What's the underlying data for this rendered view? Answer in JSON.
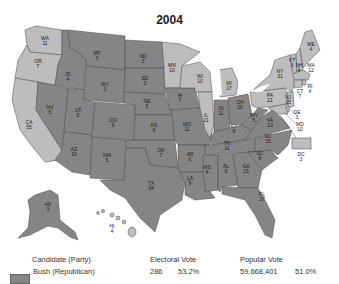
{
  "title": "2004",
  "colors": {
    "republican": "#858585",
    "democrat": "#bdbdbd"
  },
  "states": [
    {
      "abbr": "WA",
      "ev": "11",
      "party": "dem"
    },
    {
      "abbr": "OR",
      "ev": "7",
      "party": "dem"
    },
    {
      "abbr": "CA",
      "ev": "55",
      "party": "dem"
    },
    {
      "abbr": "ID",
      "ev": "4",
      "party": "rep"
    },
    {
      "abbr": "NV",
      "ev": "5",
      "party": "rep"
    },
    {
      "abbr": "MT",
      "ev": "3",
      "party": "rep"
    },
    {
      "abbr": "WY",
      "ev": "3",
      "party": "rep"
    },
    {
      "abbr": "UT",
      "ev": "5",
      "party": "rep"
    },
    {
      "abbr": "CO",
      "ev": "9",
      "party": "rep"
    },
    {
      "abbr": "AZ",
      "ev": "10",
      "party": "rep"
    },
    {
      "abbr": "NM",
      "ev": "5",
      "party": "rep"
    },
    {
      "abbr": "ND",
      "ev": "3",
      "party": "rep"
    },
    {
      "abbr": "SD",
      "ev": "3",
      "party": "rep"
    },
    {
      "abbr": "NE",
      "ev": "5",
      "party": "rep"
    },
    {
      "abbr": "KS",
      "ev": "6",
      "party": "rep"
    },
    {
      "abbr": "OK",
      "ev": "7",
      "party": "rep"
    },
    {
      "abbr": "TX",
      "ev": "34",
      "party": "rep"
    },
    {
      "abbr": "MN",
      "ev": "10",
      "party": "dem"
    },
    {
      "abbr": "IA",
      "ev": "7",
      "party": "rep"
    },
    {
      "abbr": "MO",
      "ev": "11",
      "party": "rep"
    },
    {
      "abbr": "AR",
      "ev": "6",
      "party": "rep"
    },
    {
      "abbr": "LA",
      "ev": "9",
      "party": "rep"
    },
    {
      "abbr": "WI",
      "ev": "10",
      "party": "dem"
    },
    {
      "abbr": "IL",
      "ev": "21",
      "party": "dem"
    },
    {
      "abbr": "MI",
      "ev": "17",
      "party": "dem"
    },
    {
      "abbr": "IN",
      "ev": "11",
      "party": "rep"
    },
    {
      "abbr": "OH",
      "ev": "20",
      "party": "rep"
    },
    {
      "abbr": "KY",
      "ev": "8",
      "party": "rep"
    },
    {
      "abbr": "TN",
      "ev": "11",
      "party": "rep"
    },
    {
      "abbr": "MS",
      "ev": "6",
      "party": "rep"
    },
    {
      "abbr": "AL",
      "ev": "9",
      "party": "rep"
    },
    {
      "abbr": "GA",
      "ev": "15",
      "party": "rep"
    },
    {
      "abbr": "FL",
      "ev": "27",
      "party": "rep"
    },
    {
      "abbr": "SC",
      "ev": "8",
      "party": "rep"
    },
    {
      "abbr": "NC",
      "ev": "15",
      "party": "rep"
    },
    {
      "abbr": "VA",
      "ev": "13",
      "party": "rep"
    },
    {
      "abbr": "WV",
      "ev": "5",
      "party": "rep"
    },
    {
      "abbr": "PA",
      "ev": "21",
      "party": "dem"
    },
    {
      "abbr": "NY",
      "ev": "31",
      "party": "dem"
    },
    {
      "abbr": "VT",
      "ev": "3",
      "party": "dem"
    },
    {
      "abbr": "NH",
      "ev": "4",
      "party": "dem"
    },
    {
      "abbr": "ME",
      "ev": "4",
      "party": "dem"
    },
    {
      "abbr": "MA",
      "ev": "12",
      "party": "dem"
    },
    {
      "abbr": "RI",
      "ev": "4",
      "party": "dem"
    },
    {
      "abbr": "CT",
      "ev": "7",
      "party": "dem"
    },
    {
      "abbr": "NJ",
      "ev": "15",
      "party": "dem"
    },
    {
      "abbr": "DE",
      "ev": "3",
      "party": "dem"
    },
    {
      "abbr": "MD",
      "ev": "10",
      "party": "dem"
    },
    {
      "abbr": "DC",
      "ev": "3",
      "party": "dem"
    },
    {
      "abbr": "AK",
      "ev": "3",
      "party": "rep"
    },
    {
      "abbr": "HI",
      "ev": "4",
      "party": "dem"
    }
  ],
  "legend": {
    "headers": {
      "candidate": "Candidate (Party)",
      "electoral": "Electoral Vote",
      "popular": "Popular Vote"
    },
    "rows": [
      {
        "candidate": "Bush (Republican)",
        "ev_count": "286",
        "ev_pct": "53.2%",
        "pop_count": "59,668,401",
        "pop_pct": "51.0%"
      }
    ]
  }
}
